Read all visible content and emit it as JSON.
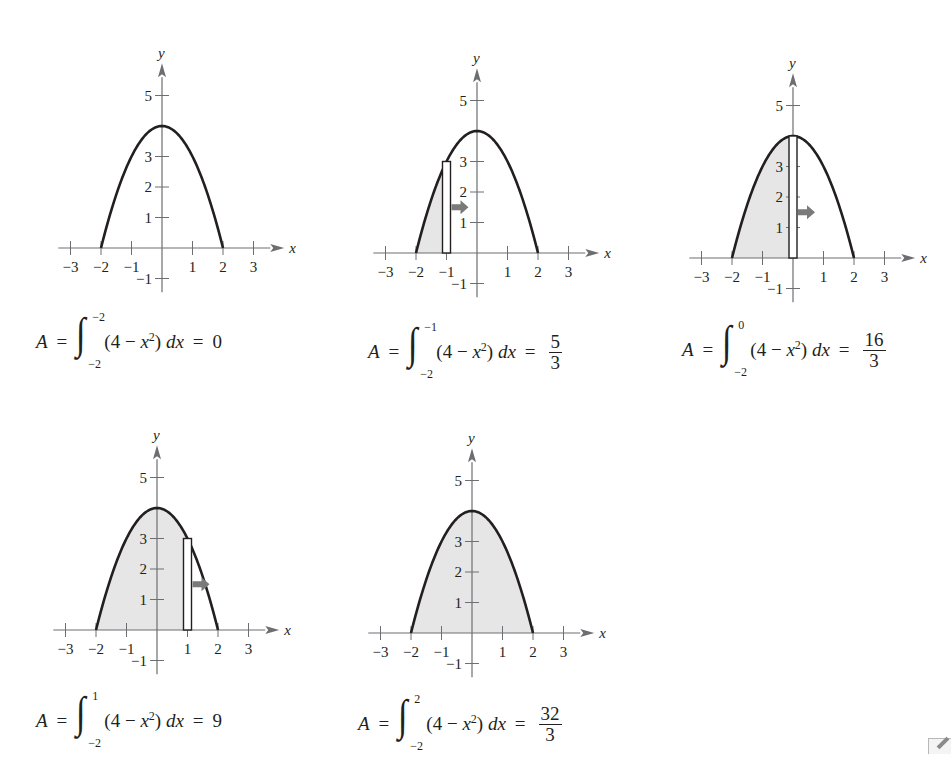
{
  "colors": {
    "ink": "#231f20",
    "axis": "#6d6e71",
    "shade": "#e6e6e6",
    "arrow": "#7a7a7a"
  },
  "chart_data": [
    {
      "type": "area",
      "title": "",
      "function": "y = 4 - x^2",
      "xlabel": "x",
      "ylabel": "y",
      "x_ticks": [
        "-3",
        "-2",
        "-1",
        "1",
        "2",
        "3"
      ],
      "y_ticks": [
        "-1",
        "1",
        "2",
        "3",
        "5"
      ],
      "xlim": [
        -3.4,
        3.6
      ],
      "ylim": [
        -1.4,
        5.9
      ],
      "shade_from": -2,
      "shade_to": -2,
      "strip_x": null,
      "formula": {
        "lhs": "A",
        "upper": "−2",
        "lower": "−2",
        "integrand": "(4 − x",
        "exp": "2",
        "tail": ") dx",
        "result": "0",
        "result_num": null,
        "result_den": null
      },
      "area_value": 0
    },
    {
      "type": "area",
      "function": "y = 4 - x^2",
      "xlabel": "x",
      "ylabel": "y",
      "x_ticks": [
        "-3",
        "-2",
        "-1",
        "1",
        "2",
        "3"
      ],
      "y_ticks": [
        "-1",
        "1",
        "2",
        "3",
        "5"
      ],
      "shade_from": -2,
      "shade_to": -1,
      "strip_x": -1,
      "formula": {
        "lhs": "A",
        "upper": "−1",
        "lower": "−2",
        "integrand": "(4 − x",
        "exp": "2",
        "tail": ") dx",
        "result": null,
        "result_num": "5",
        "result_den": "3"
      },
      "area_value": 1.667
    },
    {
      "type": "area",
      "function": "y = 4 - x^2",
      "xlabel": "x",
      "ylabel": "y",
      "x_ticks": [
        "-3",
        "-2",
        "-1",
        "1",
        "2",
        "3"
      ],
      "y_ticks": [
        "-1",
        "1",
        "2",
        "3",
        "5"
      ],
      "shade_from": -2,
      "shade_to": 0,
      "strip_x": 0,
      "formula": {
        "lhs": "A",
        "upper": "0",
        "lower": "−2",
        "integrand": "(4 − x",
        "exp": "2",
        "tail": ") dx",
        "result": null,
        "result_num": "16",
        "result_den": "3"
      },
      "area_value": 5.333
    },
    {
      "type": "area",
      "function": "y = 4 - x^2",
      "xlabel": "x",
      "ylabel": "y",
      "x_ticks": [
        "-3",
        "-2",
        "-1",
        "1",
        "2",
        "3"
      ],
      "y_ticks": [
        "-1",
        "1",
        "2",
        "3",
        "5"
      ],
      "shade_from": -2,
      "shade_to": 1,
      "strip_x": 1,
      "formula": {
        "lhs": "A",
        "upper": "1",
        "lower": "−2",
        "integrand": "(4 − x",
        "exp": "2",
        "tail": ") dx",
        "result": "9",
        "result_num": null,
        "result_den": null
      },
      "area_value": 9
    },
    {
      "type": "area",
      "function": "y = 4 - x^2",
      "xlabel": "x",
      "ylabel": "y",
      "x_ticks": [
        "-3",
        "-2",
        "-1",
        "1",
        "2",
        "3"
      ],
      "y_ticks": [
        "-1",
        "1",
        "2",
        "3",
        "5"
      ],
      "shade_from": -2,
      "shade_to": 2,
      "strip_x": null,
      "formula": {
        "lhs": "A",
        "upper": "2",
        "lower": "−2",
        "integrand": "(4 − x",
        "exp": "2",
        "tail": ") dx",
        "result": null,
        "result_num": "32",
        "result_den": "3"
      },
      "area_value": 10.667
    }
  ],
  "panels_layout": [
    {
      "ox": 162,
      "oy": 248,
      "fx": 36,
      "fy": 318
    },
    {
      "ox": 477,
      "oy": 253,
      "fx": 368,
      "fy": 328
    },
    {
      "ox": 793,
      "oy": 258,
      "fx": 682,
      "fy": 326
    },
    {
      "ox": 157,
      "oy": 630,
      "fx": 36,
      "fy": 697
    },
    {
      "ox": 472,
      "oy": 633,
      "fx": 358,
      "fy": 700
    }
  ],
  "corner_icon": "pencil-icon"
}
